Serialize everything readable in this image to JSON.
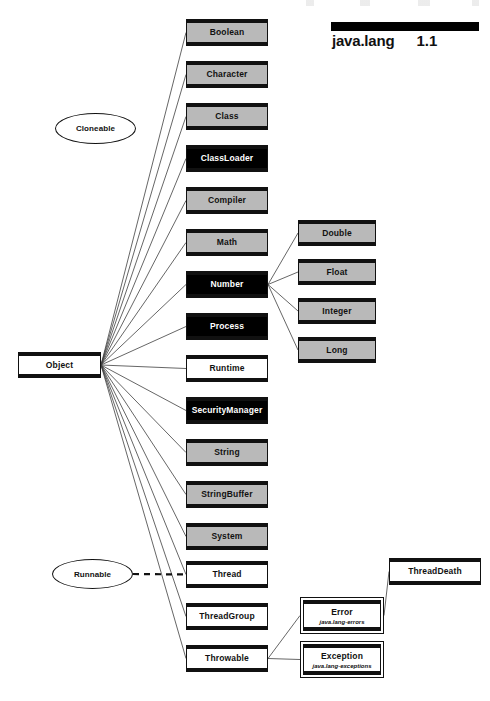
{
  "header": {
    "package_name": "java.lang",
    "version": "1.1",
    "bar_color": "#000000"
  },
  "palette": {
    "gray_fill": "#b9b9b9",
    "black_fill": "#000000",
    "white_fill": "#ffffff",
    "line_color": "#111111"
  },
  "root": {
    "label": "Object",
    "fill": "white",
    "x": 18,
    "y": 352,
    "w": 83,
    "h": 26
  },
  "interfaces": [
    {
      "label": "Cloneable",
      "x": 55,
      "y": 113,
      "w": 81,
      "h": 31
    },
    {
      "label": "Runnable",
      "x": 52,
      "y": 559,
      "w": 81,
      "h": 30
    }
  ],
  "classes": [
    {
      "label": "Boolean",
      "fill": "gray",
      "x": 186,
      "y": 19,
      "w": 82,
      "h": 27
    },
    {
      "label": "Character",
      "fill": "gray",
      "x": 186,
      "y": 61,
      "w": 82,
      "h": 27
    },
    {
      "label": "Class",
      "fill": "gray",
      "x": 186,
      "y": 103,
      "w": 82,
      "h": 27
    },
    {
      "label": "ClassLoader",
      "fill": "black",
      "x": 186,
      "y": 145,
      "w": 82,
      "h": 27
    },
    {
      "label": "Compiler",
      "fill": "gray",
      "x": 186,
      "y": 187,
      "w": 82,
      "h": 27
    },
    {
      "label": "Math",
      "fill": "gray",
      "x": 186,
      "y": 229,
      "w": 82,
      "h": 27
    },
    {
      "label": "Number",
      "fill": "black",
      "x": 186,
      "y": 271,
      "w": 82,
      "h": 27
    },
    {
      "label": "Process",
      "fill": "black",
      "x": 186,
      "y": 313,
      "w": 82,
      "h": 27
    },
    {
      "label": "Runtime",
      "fill": "white",
      "x": 186,
      "y": 355,
      "w": 82,
      "h": 27
    },
    {
      "label": "SecurityManager",
      "fill": "black",
      "x": 186,
      "y": 397,
      "w": 82,
      "h": 27
    },
    {
      "label": "String",
      "fill": "gray",
      "x": 186,
      "y": 439,
      "w": 82,
      "h": 27
    },
    {
      "label": "StringBuffer",
      "fill": "gray",
      "x": 186,
      "y": 481,
      "w": 82,
      "h": 27
    },
    {
      "label": "System",
      "fill": "gray",
      "x": 186,
      "y": 523,
      "w": 82,
      "h": 27
    },
    {
      "label": "Thread",
      "fill": "white",
      "x": 186,
      "y": 561,
      "w": 82,
      "h": 27
    },
    {
      "label": "ThreadGroup",
      "fill": "white",
      "x": 186,
      "y": 603,
      "w": 82,
      "h": 27
    },
    {
      "label": "Throwable",
      "fill": "white",
      "x": 186,
      "y": 645,
      "w": 82,
      "h": 27
    }
  ],
  "number_subclasses": [
    {
      "label": "Double",
      "fill": "gray",
      "x": 298,
      "y": 220,
      "w": 78,
      "h": 26
    },
    {
      "label": "Float",
      "fill": "gray",
      "x": 298,
      "y": 259,
      "w": 78,
      "h": 26
    },
    {
      "label": "Integer",
      "fill": "gray",
      "x": 298,
      "y": 298,
      "w": 78,
      "h": 26
    },
    {
      "label": "Long",
      "fill": "gray",
      "x": 298,
      "y": 337,
      "w": 78,
      "h": 26
    }
  ],
  "throwable_subclasses": [
    {
      "label": "Error",
      "subtitle": "java.lang-errors",
      "fill": "white",
      "x": 300,
      "y": 597,
      "w": 84,
      "h": 37
    },
    {
      "label": "Exception",
      "subtitle": "java.lang-exceptions",
      "fill": "white",
      "x": 300,
      "y": 641,
      "w": 84,
      "h": 37
    }
  ],
  "error_subclasses": [
    {
      "label": "ThreadDeath",
      "fill": "white",
      "x": 389,
      "y": 558,
      "w": 92,
      "h": 27
    }
  ],
  "edges": {
    "inheritance_label": "extends",
    "implements_label": "implements",
    "object_children": [
      "Boolean",
      "Character",
      "Class",
      "ClassLoader",
      "Compiler",
      "Math",
      "Number",
      "Process",
      "Runtime",
      "SecurityManager",
      "String",
      "StringBuffer",
      "System",
      "Thread",
      "ThreadGroup",
      "Throwable"
    ],
    "number_children": [
      "Double",
      "Float",
      "Integer",
      "Long"
    ],
    "throwable_children": [
      "Error",
      "Exception"
    ],
    "error_children": [
      "ThreadDeath"
    ],
    "implements_edges": [
      {
        "from": "Runnable",
        "to": "Thread",
        "style": "dashed"
      }
    ]
  }
}
